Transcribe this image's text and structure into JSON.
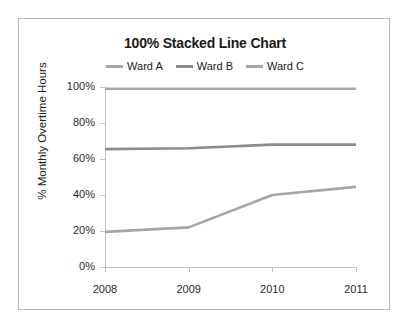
{
  "chart_data": {
    "type": "line",
    "title": "100% Stacked Line Chart",
    "xlabel": "",
    "ylabel": "% Monthly Overtime Hours",
    "categories": [
      "2008",
      "2009",
      "2010",
      "2011"
    ],
    "x_tick_labels": [
      "2008",
      "2009",
      "2010",
      "2011"
    ],
    "y_tick_labels": [
      "0%",
      "20%",
      "40%",
      "60%",
      "80%",
      "100%"
    ],
    "y_tick_values": [
      0,
      20,
      40,
      60,
      80,
      100
    ],
    "ylim": [
      0,
      100
    ],
    "grid": false,
    "legend_position": "top",
    "series": [
      {
        "name": "Ward A",
        "color": "#a6a6a6",
        "values": [
          19.5,
          22,
          40,
          44.5
        ]
      },
      {
        "name": "Ward B",
        "color": "#8c8c8c",
        "values": [
          65.5,
          66,
          68,
          68
        ]
      },
      {
        "name": "Ward C",
        "color": "#a6a6a6",
        "values": [
          99,
          99,
          99,
          99
        ]
      }
    ]
  },
  "legend": {
    "entries": [
      {
        "label": "Ward A"
      },
      {
        "label": "Ward B"
      },
      {
        "label": "Ward C"
      }
    ]
  },
  "axes": {
    "y_title": "% Monthly Overtime Hours"
  },
  "colors": {
    "frame": "#b9b9b9",
    "axis": "#c3c3c3",
    "text": "#1a1a1a"
  }
}
